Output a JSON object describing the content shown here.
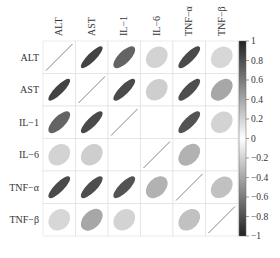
{
  "chart_data": {
    "type": "heatmap",
    "subtype": "correlation-ellipse-matrix",
    "title": "",
    "variables": [
      "ALT",
      "AST",
      "IL−1",
      "IL−6",
      "TNF−α",
      "TNF−β"
    ],
    "matrix": [
      [
        1.0,
        0.85,
        0.7,
        0.2,
        0.82,
        0.18
      ],
      [
        0.85,
        1.0,
        0.82,
        0.22,
        0.8,
        0.4
      ],
      [
        0.7,
        0.82,
        1.0,
        0.0,
        0.78,
        0.2
      ],
      [
        0.2,
        0.22,
        0.0,
        1.0,
        0.35,
        0.0
      ],
      [
        0.82,
        0.8,
        0.78,
        0.35,
        1.0,
        0.28
      ],
      [
        0.18,
        0.4,
        0.2,
        0.0,
        0.28,
        1.0
      ]
    ],
    "colorbar": {
      "min": -1,
      "max": 1,
      "ticks": [
        1,
        0.8,
        0.6,
        0.4,
        0.2,
        0,
        -0.2,
        -0.4,
        -0.6,
        -0.8,
        -1
      ],
      "tick_labels": [
        "1",
        "0.8",
        "0.6",
        "0.4",
        "0.2",
        "0",
        "−0.2",
        "−0.4",
        "−0.6",
        "−0.8",
        "−1"
      ],
      "colors": {
        "high": "#222222",
        "mid": "#ffffff",
        "low": "#222222"
      }
    },
    "grid": true,
    "legend_position": "right"
  }
}
